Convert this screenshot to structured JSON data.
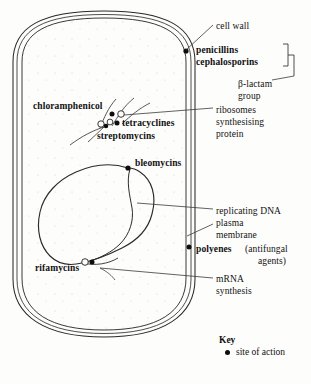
{
  "figure": {
    "type": "biology-diagram",
    "background_color": "#fdfdfc",
    "ink_color": "#111111"
  },
  "cell": {
    "shape": "rod-shaped bacterium with rounded ends",
    "envelope_layers": [
      "cell wall outer line",
      "cell wall inner line",
      "plasma membrane"
    ],
    "structures": [
      {
        "name": "cell-wall",
        "label": "cell wall"
      },
      {
        "name": "plasma-membrane",
        "label": "plasma\nmembrane"
      },
      {
        "name": "nucleoid",
        "label": "replicating DNA"
      },
      {
        "name": "ribosomes",
        "label": "ribosomes\nsynthesising\nprotein"
      },
      {
        "name": "mrna",
        "label": "mRNA\nsynthesis"
      }
    ]
  },
  "drug_labels": [
    {
      "id": "penicillins",
      "text": "penicillins",
      "bold": true,
      "x": 196,
      "y": 50
    },
    {
      "id": "cephalosporins",
      "text": "cephalosporins",
      "bold": true,
      "x": 196,
      "y": 62
    },
    {
      "id": "chloramphenicol",
      "text": "chloramphenicol",
      "bold": true,
      "x": 33,
      "y": 106
    },
    {
      "id": "tetracyclines",
      "text": "tetracyclines",
      "bold": true,
      "x": 122,
      "y": 123
    },
    {
      "id": "streptomycins",
      "text": "streptomycins",
      "bold": true,
      "x": 97,
      "y": 136
    },
    {
      "id": "bleomycins",
      "text": "bleomycins",
      "bold": true,
      "x": 135,
      "y": 163
    },
    {
      "id": "polyenes",
      "text": "polyenes",
      "bold": true,
      "x": 196,
      "y": 249
    },
    {
      "id": "rifamycins",
      "text": "rifamycins",
      "bold": true,
      "x": 35,
      "y": 268
    }
  ],
  "structure_labels": [
    {
      "id": "cell-wall",
      "text": "cell wall",
      "bold": false,
      "x": 216,
      "y": 26
    },
    {
      "id": "beta-lactam-line1",
      "text": "β-lactam",
      "bold": false,
      "x": 238,
      "y": 84
    },
    {
      "id": "beta-lactam-line2",
      "text": "group",
      "bold": false,
      "x": 238,
      "y": 96
    },
    {
      "id": "ribosomes-line1",
      "text": "ribosomes",
      "bold": false,
      "x": 216,
      "y": 110
    },
    {
      "id": "ribosomes-line2",
      "text": "synthesising",
      "bold": false,
      "x": 216,
      "y": 122
    },
    {
      "id": "ribosomes-line3",
      "text": "protein",
      "bold": false,
      "x": 216,
      "y": 134
    },
    {
      "id": "replicating-dna",
      "text": "replicating DNA",
      "bold": false,
      "x": 216,
      "y": 211
    },
    {
      "id": "plasma-line1",
      "text": "plasma",
      "bold": false,
      "x": 216,
      "y": 223
    },
    {
      "id": "plasma-line2",
      "text": "membrane",
      "bold": false,
      "x": 216,
      "y": 235
    },
    {
      "id": "antifungal-line1",
      "text": "(antifungal",
      "bold": false,
      "x": 238,
      "y": 249
    },
    {
      "id": "antifungal-line2",
      "text": "agents)",
      "bold": false,
      "x": 248,
      "y": 261
    },
    {
      "id": "mrna-line1",
      "text": "mRNA",
      "bold": false,
      "x": 216,
      "y": 279
    },
    {
      "id": "mrna-line2",
      "text": "synthesis",
      "bold": false,
      "x": 216,
      "y": 291
    }
  ],
  "key": {
    "title": "Key",
    "entries": [
      {
        "marker": "filled-dot",
        "label": "site of action"
      }
    ]
  },
  "sites_of_action": [
    {
      "drug": "penicillins / cephalosporins",
      "target": "cell wall",
      "x": 186,
      "y": 51
    },
    {
      "drug": "chloramphenicol",
      "target": "ribosome",
      "x": 112,
      "y": 114
    },
    {
      "drug": "tetracyclines",
      "target": "ribosome",
      "x": 117,
      "y": 123
    },
    {
      "drug": "streptomycins",
      "target": "ribosome",
      "x": 106,
      "y": 125
    },
    {
      "drug": "bleomycins",
      "target": "replicating DNA",
      "x": 128,
      "y": 168
    },
    {
      "drug": "polyenes",
      "target": "plasma membrane",
      "x": 189,
      "y": 247
    },
    {
      "drug": "rifamycins",
      "target": "mRNA synthesis",
      "x": 83,
      "y": 263
    }
  ]
}
